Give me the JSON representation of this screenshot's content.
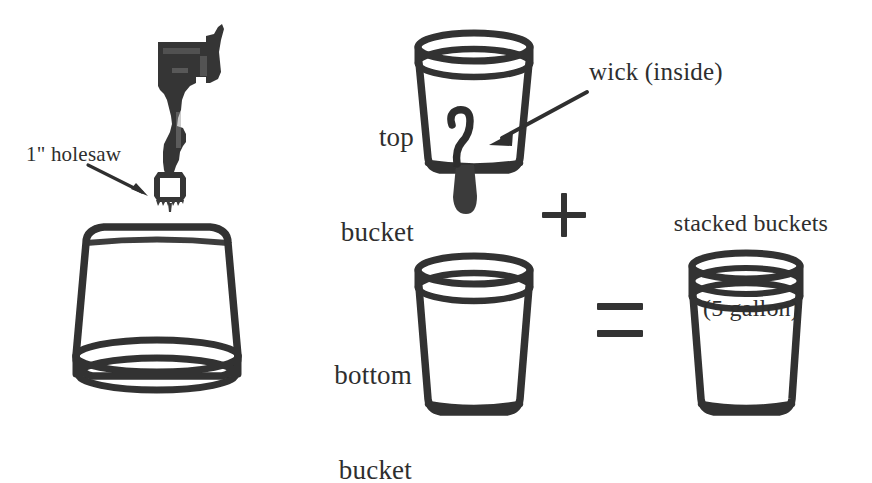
{
  "figure": {
    "background_color": "#ffffff",
    "ink_color": "#2f2f2f"
  },
  "labels": {
    "holesaw": "1\" holesaw",
    "top_bucket_line1": "top",
    "top_bucket_line2": "bucket",
    "wick": "wick (inside)",
    "stacked_line1": "stacked buckets",
    "stacked_line2": "(5 gallon)",
    "bottom_bucket_line1": "bottom",
    "bottom_bucket_line2": "bucket"
  },
  "operators": {
    "plus": "+",
    "equals": "="
  },
  "objects": [
    {
      "name": "drill-with-holesaw",
      "description": "Power drill silhouette held vertically with a 1 inch holesaw bit pointing down at the inverted bucket",
      "fill": "#333333"
    },
    {
      "name": "inverted-bucket",
      "description": "Five gallon bucket shown upside down, rim at the bottom, being drilled from above"
    },
    {
      "name": "top-bucket",
      "description": "Upright five gallon bucket with rim at top and a wick threaded through a hole in its base"
    },
    {
      "name": "wick",
      "description": "S-curved wick inside the top bucket passing through the base and hanging below as a dark tail"
    },
    {
      "name": "bottom-bucket",
      "description": "Upright five gallon bucket with rim at top"
    },
    {
      "name": "stacked-buckets",
      "description": "Result: top bucket nested into bottom bucket showing a doubled rim"
    }
  ],
  "arrows": [
    {
      "name": "holesaw-arrow",
      "from": "1\" holesaw label",
      "to": "holesaw bit"
    },
    {
      "name": "wick-arrow",
      "from": "wick (inside) label",
      "to": "wick inside top bucket"
    }
  ]
}
